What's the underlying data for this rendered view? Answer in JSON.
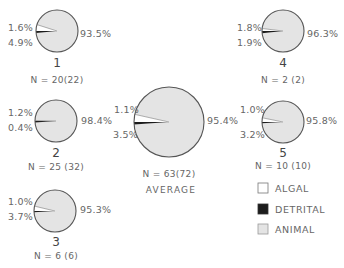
{
  "colors": {
    "algal": "#ffffff",
    "detrital": "#1c1c1c",
    "animal": "#e4e4e4",
    "outline": "#555555",
    "text": "#666666"
  },
  "chart_data": {
    "type": "pie",
    "title": "",
    "legend": [
      "ALGAL",
      "DETRITAL",
      "ANIMAL"
    ],
    "legend_position": "bottom-right",
    "pies": [
      {
        "id": "1",
        "label": "1",
        "n": "N = 20(22)",
        "algal": 4.9,
        "detrital": 1.6,
        "animal": 93.5,
        "cx": 57,
        "cy": 31,
        "r": 21
      },
      {
        "id": "4",
        "label": "4",
        "n": "N = 2 (2)",
        "algal": 1.9,
        "detrital": 1.8,
        "animal": 96.3,
        "cx": 283,
        "cy": 31,
        "r": 21
      },
      {
        "id": "2",
        "label": "2",
        "n": "N = 25 (32)",
        "algal": 0.4,
        "detrital": 1.2,
        "animal": 98.4,
        "cx": 56,
        "cy": 121,
        "r": 21
      },
      {
        "id": "avg",
        "label": "AVERAGE",
        "n": "N = 63(72)",
        "algal": 3.5,
        "detrital": 1.1,
        "animal": 95.4,
        "cx": 169,
        "cy": 122,
        "r": 35
      },
      {
        "id": "5",
        "label": "5",
        "n": "N = 10 (10)",
        "algal": 3.2,
        "detrital": 1.0,
        "animal": 95.8,
        "cx": 283,
        "cy": 122,
        "r": 21
      },
      {
        "id": "3",
        "label": "3",
        "n": "N = 6 (6)",
        "algal": 3.7,
        "detrital": 1.0,
        "animal": 95.3,
        "cx": 55,
        "cy": 211,
        "r": 21
      }
    ]
  },
  "labels": {
    "p1": {
      "detrital": "1.6%",
      "algal": "4.9%",
      "animal": "93.5%",
      "id": "1",
      "n": "N = 20(22)"
    },
    "p4": {
      "detrital": "1.8%",
      "algal": "1.9%",
      "animal": "96.3%",
      "id": "4",
      "n": "N = 2 (2)"
    },
    "p2": {
      "detrital": "1.2%",
      "algal": "0.4%",
      "animal": "98.4%",
      "id": "2",
      "n": "N = 25 (32)"
    },
    "avg": {
      "detrital": "1.1%",
      "algal": "3.5%",
      "animal": "95.4%",
      "n": "N = 63(72)",
      "title": "AVERAGE"
    },
    "p5": {
      "detrital": "1.0%",
      "algal": "3.2%",
      "animal": "95.8%",
      "id": "5",
      "n": "N = 10 (10)"
    },
    "p3": {
      "detrital": "1.0%",
      "algal": "3.7%",
      "animal": "95.3%",
      "id": "3",
      "n": "N = 6 (6)"
    }
  },
  "legend": {
    "algal": "ALGAL",
    "detrital": "DETRITAL",
    "animal": "ANIMAL"
  }
}
